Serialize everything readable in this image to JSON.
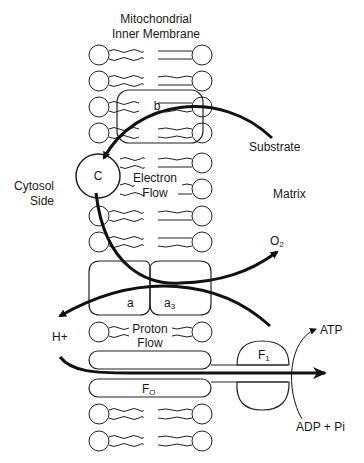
{
  "title_line1": "Mitochondrial",
  "title_line2": "Inner Membrane",
  "labels": {
    "cytosol_line1": "Cytosol",
    "cytosol_line2": "Side",
    "matrix": "Matrix",
    "substrate": "Substrate",
    "electron_line1": "Electron",
    "electron_line2": "Flow",
    "proton_line1": "Proton",
    "proton_line2": "Flow",
    "o2": "O",
    "o2_sub": "2",
    "h_plus": "H+",
    "atp": "ATP",
    "adp": "ADP + Pi"
  },
  "components": {
    "b": "b",
    "c": "C",
    "a": "a",
    "a3": "a",
    "a3_sub": "3",
    "f1": "F",
    "f1_sub": "1",
    "f0": "F",
    "f0_sub": "O"
  },
  "colors": {
    "stroke": "#1a1a1a",
    "background": "#ffffff"
  }
}
